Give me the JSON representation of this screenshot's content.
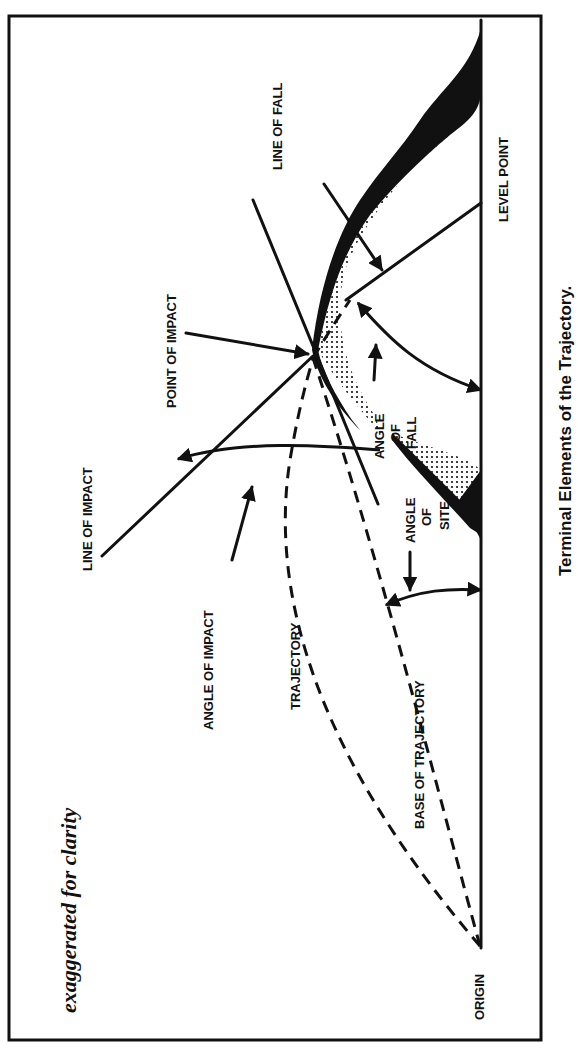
{
  "title": "Terminal Elements of the Trajectory.",
  "note": "exaggerated for clarity",
  "labels": {
    "line_of_fall": "LINE OF FALL",
    "level_point": "LEVEL POINT",
    "point_of_impact": "POINT OF IMPACT",
    "line_of_impact": "LINE OF IMPACT",
    "angle_of_fall_1": "ANGLE",
    "angle_of_fall_2": "OF",
    "angle_of_fall_3": "FALL",
    "angle_of_site_1": "ANGLE",
    "angle_of_site_2": "OF",
    "angle_of_site_3": "SITE",
    "angle_of_impact": "ANGLE OF IMPACT",
    "trajectory": "TRAJECTORY",
    "base_of_trajectory": "BASE OF TRAJECTORY",
    "origin": "ORIGIN"
  }
}
